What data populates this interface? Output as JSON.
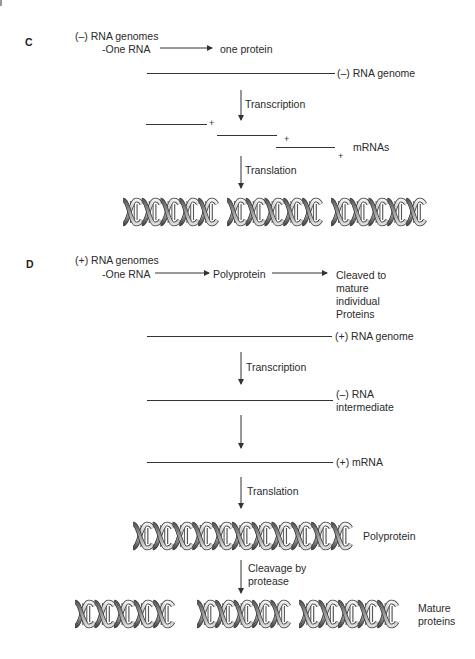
{
  "figure": {
    "panels": [
      {
        "label": "C",
        "title": "(–) RNA genomes",
        "summary": {
          "source": "-One RNA",
          "products": [
            "one protein"
          ]
        },
        "genome_label": "(–) RNA genome",
        "step1_label": "Transcription",
        "mrna_plus_signs": [
          "+",
          "+",
          "+"
        ],
        "mrna_label": "mRNAs",
        "step2_label": "Translation",
        "protein_count": 3
      },
      {
        "label": "D",
        "title": "(+) RNA genomes",
        "summary": {
          "source": "-One RNA",
          "products": [
            "Polyprotein",
            "Cleaved to\nmature\nindividual\nProteins"
          ]
        },
        "genome_label": "(+) RNA genome",
        "step1_label": "Transcription",
        "intermediate_label": "(–) RNA\nintermediate",
        "mrna_label": "(+) mRNA",
        "step3_label": "Translation",
        "polyprotein_label": "Polyprotein",
        "step4_label": "Cleavage by\nprotease",
        "mature_label": "Mature\nproteins",
        "mature_protein_count": 3
      }
    ],
    "colors": {
      "line": "#333333",
      "text": "#2a2a2a",
      "helix_light": "#e6e6e6",
      "helix_mid": "#9a9a9a",
      "helix_dark": "#4a4a4a"
    }
  }
}
